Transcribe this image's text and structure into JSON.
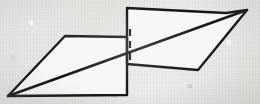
{
  "figure": {
    "title": "Hand-drawn geometric figure",
    "medium": "pencil-on-paper",
    "colors": {
      "paper": "#e9e9e7",
      "paper_shade": "#e3e3e0",
      "ink": "#141414",
      "fill": "#f7f7f6",
      "grain": "#969694"
    },
    "canvas": {
      "width": 260,
      "height": 104
    },
    "strokes": {
      "outline_width": 2.4,
      "diagonal_width": 2.6,
      "dashed_width": 2.2,
      "dash_pattern": "7 5"
    },
    "shapes": {
      "left_parallelogram": {
        "name": "left-parallelogram",
        "points": "8,96 65,36 127,37 127,95",
        "vertices": [
          {
            "label": "left-apex",
            "x": 8,
            "y": 96
          },
          {
            "label": "upper-left",
            "x": 65,
            "y": 36
          },
          {
            "label": "upper-right",
            "x": 127,
            "y": 37
          },
          {
            "label": "lower-right",
            "x": 127,
            "y": 95
          }
        ]
      },
      "right_parallelogram": {
        "name": "right-parallelogram",
        "points": "127,8 226,13 247,10 198,70 127,64",
        "vertices": [
          {
            "label": "upper-left",
            "x": 127,
            "y": 8
          },
          {
            "label": "top-bend",
            "x": 226,
            "y": 13
          },
          {
            "label": "right-apex",
            "x": 247,
            "y": 10
          },
          {
            "label": "lower-right",
            "x": 198,
            "y": 70
          },
          {
            "label": "lower-left",
            "x": 127,
            "y": 64
          }
        ]
      }
    },
    "lines": {
      "long_diagonal": {
        "name": "long-diagonal",
        "x1": 8,
        "y1": 96,
        "x2": 247,
        "y2": 10
      },
      "dashed_hidden_edge": {
        "name": "dashed-hidden-edge",
        "x1": 130,
        "y1": 29,
        "x2": 130,
        "y2": 63
      },
      "left_bottom_edge": {
        "name": "left-bottom-edge",
        "x1": 8,
        "y1": 96,
        "x2": 127,
        "y2": 95
      }
    }
  }
}
